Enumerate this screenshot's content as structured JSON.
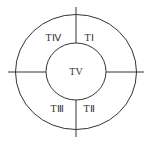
{
  "diagram": {
    "type": "concentric-quadrant-diagram",
    "colors": {
      "stroke": "#333333",
      "background": "#ffffff",
      "text": "#333333"
    },
    "center": {
      "label": "TV"
    },
    "quadrants": [
      {
        "position": "top-right",
        "label": "TⅠ"
      },
      {
        "position": "bottom-right",
        "label": "TⅡ"
      },
      {
        "position": "bottom-left",
        "label": "TⅢ"
      },
      {
        "position": "top-left",
        "label": "TⅣ"
      }
    ]
  }
}
